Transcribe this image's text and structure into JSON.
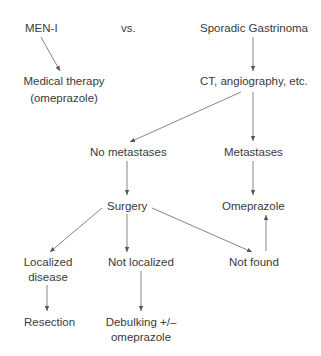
{
  "diagram": {
    "nodes": {
      "men1": "MEN-I",
      "vs": "vs.",
      "sporadic": "Sporadic Gastrinoma",
      "medical_line1": "Medical therapy",
      "medical_line2": "(omeprazole)",
      "ct": "CT, angiography, etc.",
      "no_metastases": "No metastases",
      "metastases": "Metastases",
      "surgery": "Surgery",
      "omeprazole": "Omeprazole",
      "localized_line1": "Localized",
      "localized_line2": "disease",
      "not_localized": "Not localized",
      "not_found": "Not found",
      "resection": "Resection",
      "debulking_line1": "Debulking +/–",
      "debulking_line2": "omeprazole"
    },
    "edges": [
      {
        "from": "MEN-I",
        "to": "Medical therapy (omeprazole)"
      },
      {
        "from": "Sporadic Gastrinoma",
        "to": "CT, angiography, etc."
      },
      {
        "from": "CT, angiography, etc.",
        "to": "No metastases"
      },
      {
        "from": "CT, angiography, etc.",
        "to": "Metastases"
      },
      {
        "from": "No metastases",
        "to": "Surgery"
      },
      {
        "from": "Metastases",
        "to": "Omeprazole"
      },
      {
        "from": "Surgery",
        "to": "Localized disease"
      },
      {
        "from": "Surgery",
        "to": "Not localized"
      },
      {
        "from": "Surgery",
        "to": "Not found"
      },
      {
        "from": "Not found",
        "to": "Omeprazole"
      },
      {
        "from": "Localized disease",
        "to": "Resection"
      },
      {
        "from": "Not localized",
        "to": "Debulking +/– omeprazole"
      }
    ],
    "colors": {
      "text": "#3a3a3a",
      "line": "#555555",
      "background": "#ffffff"
    }
  }
}
